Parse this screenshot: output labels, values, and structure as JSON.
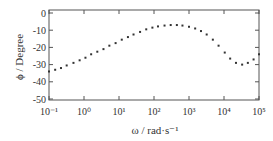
{
  "chart_data": {
    "type": "scatter",
    "title": "",
    "xlabel": "ω / rad·s⁻¹",
    "ylabel": "ϕ / Degree",
    "xscale": "log",
    "xlim": [
      0.1,
      100000
    ],
    "ylim": [
      -50,
      0
    ],
    "x_ticks": [
      "10⁻¹",
      "10⁰",
      "10¹",
      "10²",
      "10³",
      "10⁴",
      "10⁵"
    ],
    "y_ticks": [
      "0",
      "-10",
      "-20",
      "-30",
      "-40",
      "-50"
    ],
    "grid": false,
    "legend": null,
    "series": [
      {
        "name": "phase",
        "marker": "dot",
        "color": "#333333",
        "points": [
          [
            0.1,
            -34
          ],
          [
            0.15,
            -33
          ],
          [
            0.22,
            -32
          ],
          [
            0.32,
            -30.5
          ],
          [
            0.5,
            -29
          ],
          [
            0.75,
            -27.5
          ],
          [
            1.1,
            -26
          ],
          [
            1.6,
            -24
          ],
          [
            2.4,
            -22.5
          ],
          [
            3.6,
            -21
          ],
          [
            5.3,
            -19
          ],
          [
            8,
            -17.5
          ],
          [
            12,
            -15.5
          ],
          [
            18,
            -14
          ],
          [
            26,
            -12.5
          ],
          [
            40,
            -11
          ],
          [
            60,
            -9.5
          ],
          [
            90,
            -8.5
          ],
          [
            130,
            -7.8
          ],
          [
            200,
            -7.3
          ],
          [
            300,
            -7
          ],
          [
            450,
            -7
          ],
          [
            650,
            -7.3
          ],
          [
            1000,
            -8
          ],
          [
            1500,
            -9
          ],
          [
            2200,
            -10.5
          ],
          [
            3200,
            -12.5
          ],
          [
            4800,
            -15.5
          ],
          [
            7000,
            -19
          ],
          [
            10500,
            -23
          ],
          [
            15000,
            -26.5
          ],
          [
            22000,
            -29
          ],
          [
            33000,
            -30
          ],
          [
            48000,
            -29
          ],
          [
            70000,
            -27
          ],
          [
            100000,
            -24
          ]
        ]
      }
    ]
  }
}
